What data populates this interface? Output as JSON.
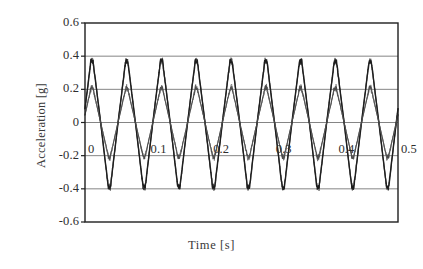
{
  "chart_data": {
    "type": "line",
    "title": "",
    "xlabel": "Time [s]",
    "ylabel": "Acceleration [g]",
    "xlim": [
      0,
      0.5
    ],
    "ylim": [
      -0.6,
      0.6
    ],
    "grid": true,
    "grid_axis": "y",
    "legend": "none",
    "xticks": [
      0,
      0.1,
      0.2,
      0.3,
      0.4,
      0.5
    ],
    "xticklabels": [
      "0",
      "0.1",
      "0.2",
      "0.3",
      "0.4",
      "0.5"
    ],
    "xtick_labels_inside_plot": true,
    "yticks": [
      -0.6,
      -0.4,
      -0.2,
      0,
      0.2,
      0.4,
      0.6
    ],
    "yticklabels": [
      "-0.6",
      "-0.4",
      "-0.2",
      "0",
      "0.2",
      "0.4",
      "0.6"
    ],
    "cycles": 9,
    "frequency_hz": 18,
    "series": [
      {
        "name": "large-amplitude-trace",
        "color": "#1c1c1c",
        "amplitude": 0.37,
        "trough": -0.39,
        "peak": 0.37,
        "waveform": "clipped-triangular-oscillation-with-noisy-peaks"
      },
      {
        "name": "small-amplitude-trace",
        "color": "#4a4a4a",
        "amplitude": 0.21,
        "trough": -0.21,
        "peak": 0.21,
        "waveform": "clipped-triangular-oscillation-with-noisy-peaks"
      }
    ],
    "sampling": {
      "points_per_cycle": 96,
      "noise_amplitude": 0.012
    }
  },
  "axis": {
    "ylabel_text": "Acceleration [g]",
    "xlabel_text": "Time [s]"
  }
}
